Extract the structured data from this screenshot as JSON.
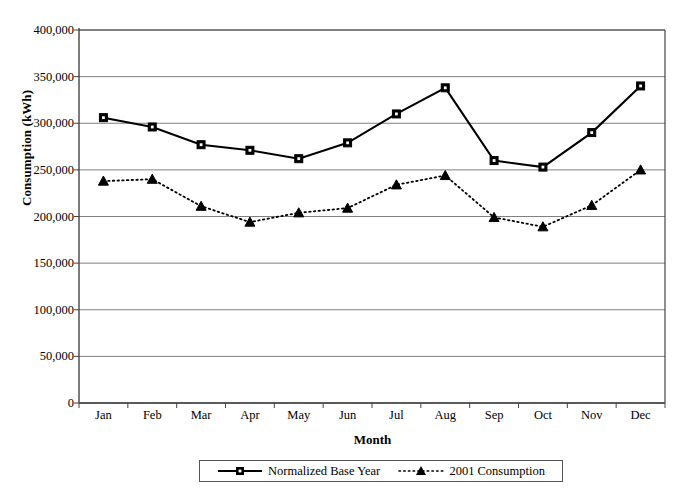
{
  "chart_data": {
    "type": "line",
    "title": "",
    "xlabel": "Month",
    "ylabel": "Consumption (kWh)",
    "categories": [
      "Jan",
      "Feb",
      "Mar",
      "Apr",
      "May",
      "Jun",
      "Jul",
      "Aug",
      "Sep",
      "Oct",
      "Nov",
      "Dec"
    ],
    "ylim": [
      0,
      400000
    ],
    "yticks": [
      0,
      50000,
      100000,
      150000,
      200000,
      250000,
      300000,
      350000,
      400000
    ],
    "ytick_labels": [
      "0",
      "50,000",
      "100,000",
      "150,000",
      "200,000",
      "250,000",
      "300,000",
      "350,000",
      "400,000"
    ],
    "grid": true,
    "grid_axis": "y",
    "legend_position": "bottom",
    "series": [
      {
        "name": "Normalized Base Year",
        "marker": "square",
        "linestyle": "solid",
        "color": "#000000",
        "values": [
          306000,
          296000,
          277000,
          271000,
          262000,
          279000,
          310000,
          338000,
          260000,
          253000,
          290000,
          340000
        ]
      },
      {
        "name": "2001 Consumption",
        "marker": "triangle",
        "linestyle": "dotted",
        "color": "#000000",
        "values": [
          238000,
          240000,
          211000,
          194000,
          204000,
          209000,
          234000,
          244000,
          199000,
          189000,
          212000,
          250000
        ]
      }
    ]
  }
}
